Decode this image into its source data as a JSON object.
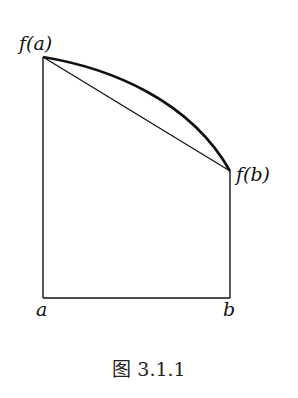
{
  "figure": {
    "caption": "图 3.1.1",
    "labels": {
      "fa": "f(a)",
      "fb": "f(b)",
      "a": "a",
      "b": "b"
    }
  },
  "geometry": {
    "left_x": 43,
    "right_x": 230,
    "base_y": 298,
    "fa_y": 57,
    "fb_y": 171,
    "curve": "concave (bulges above chord)",
    "chord": "straight segment from (a,f(a)) to (b,f(b))"
  },
  "colors": {
    "line": "#111111",
    "background": "#ffffff"
  }
}
